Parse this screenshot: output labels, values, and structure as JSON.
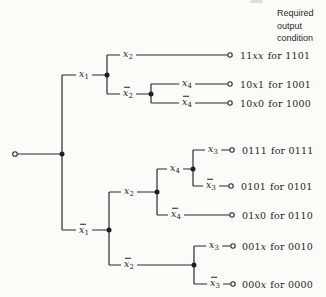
{
  "figure": {
    "header": [
      "Required",
      "output",
      "condition"
    ],
    "branch_labels": [
      {
        "var": "x",
        "sub": "1",
        "bar": false
      },
      {
        "var": "x",
        "sub": "2",
        "bar": false
      },
      {
        "var": "x",
        "sub": "2",
        "bar": true
      },
      {
        "var": "x",
        "sub": "4",
        "bar": false
      },
      {
        "var": "x",
        "sub": "4",
        "bar": true
      },
      {
        "var": "x",
        "sub": "1",
        "bar": true
      },
      {
        "var": "x",
        "sub": "2",
        "bar": false
      },
      {
        "var": "x",
        "sub": "4",
        "bar": false
      },
      {
        "var": "x",
        "sub": "3",
        "bar": false
      },
      {
        "var": "x",
        "sub": "3",
        "bar": true
      },
      {
        "var": "x",
        "sub": "4",
        "bar": true
      },
      {
        "var": "x",
        "sub": "2",
        "bar": true
      },
      {
        "var": "x",
        "sub": "3",
        "bar": false
      },
      {
        "var": "x",
        "sub": "3",
        "bar": true
      }
    ],
    "outputs": [
      {
        "pattern": "11xx",
        "condition": "for 1101"
      },
      {
        "pattern": "10x1",
        "condition": "for 1001"
      },
      {
        "pattern": "10x0",
        "condition": "for 1000"
      },
      {
        "pattern": "0111",
        "condition": "for 0111"
      },
      {
        "pattern": "0101",
        "condition": "for 0101"
      },
      {
        "pattern": "01x0",
        "condition": "for 0110"
      },
      {
        "pattern": "001x",
        "condition": "for 0010"
      },
      {
        "pattern": "000x",
        "condition": "for 0000"
      }
    ],
    "colors": {
      "ink": "#2b2b2b",
      "paper": "#fbfbf8"
    }
  }
}
